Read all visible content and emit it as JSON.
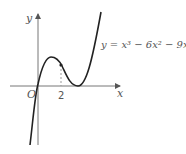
{
  "diagram": {
    "type": "function-graph",
    "equation": "y = x³ − 6x² − 9x",
    "axis_x_label": "x",
    "axis_y_label": "y",
    "origin_label": "O",
    "tick_label": "2",
    "colors": {
      "curve": "#222222",
      "axes": "#777777",
      "dashed": "#999999"
    }
  }
}
